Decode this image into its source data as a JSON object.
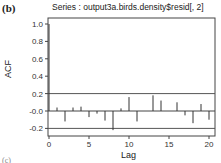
{
  "figure": {
    "panel_label": "(b)",
    "next_panel_label": "(c)"
  },
  "chart_data": {
    "type": "bar",
    "title": "Series : output3a.birds.density$resid[, 2]",
    "xlabel": "Lag",
    "ylabel": "ACF",
    "x": [
      0,
      1,
      2,
      3,
      4,
      5,
      6,
      7,
      8,
      9,
      10,
      11,
      12,
      13,
      14,
      15,
      16,
      17,
      18,
      19,
      20
    ],
    "values": [
      1.0,
      0.04,
      -0.12,
      0.04,
      0.05,
      -0.07,
      -0.03,
      -0.11,
      -0.22,
      0.03,
      0.16,
      -0.12,
      0.0,
      0.18,
      0.12,
      0.0,
      0.1,
      -0.05,
      -0.14,
      0.08,
      -0.1
    ],
    "confidence_bounds": [
      0.2,
      -0.2
    ],
    "ylim": [
      -0.27,
      1.05
    ],
    "xlim": [
      -0.5,
      20.5
    ],
    "yticks": [
      "-0.2",
      "-0.0",
      "0.2",
      "0.4",
      "0.6",
      "0.8",
      "1.0"
    ],
    "ytick_values": [
      -0.2,
      0.0,
      0.2,
      0.4,
      0.6,
      0.8,
      1.0
    ],
    "xticks": [
      "0",
      "5",
      "10",
      "15",
      "20"
    ],
    "xtick_values": [
      0,
      5,
      10,
      15,
      20
    ],
    "grid": false,
    "legend": null
  }
}
